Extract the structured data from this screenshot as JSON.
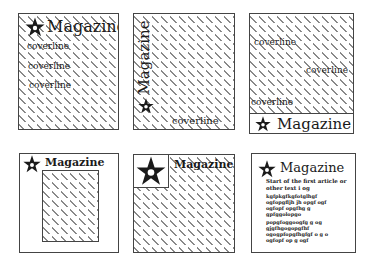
{
  "layouts": [
    {
      "id": "layout-1",
      "masthead": "Magazine",
      "coverlines": [
        "coverline",
        "coverline",
        "coverline"
      ]
    },
    {
      "id": "layout-2",
      "masthead": "Magazine",
      "masthead_orientation": "vertical",
      "coverlines": [
        "coverline"
      ]
    },
    {
      "id": "layout-3",
      "masthead": "Magazine",
      "masthead_position": "bottom-strip",
      "coverlines": [
        "coverline",
        "coverline",
        "coverline"
      ]
    },
    {
      "id": "layout-4",
      "masthead": "Magazine",
      "image": "inset-rectangle"
    },
    {
      "id": "layout-5",
      "masthead": "Magazine",
      "logo": "large-star-box"
    },
    {
      "id": "layout-6",
      "masthead": "Magazine",
      "article_intro": "Start of the first article or other text i og",
      "article_lines": [
        "kgfpkgfkgfotglhgf",
        "ogfopgfljh jh opgf ogf",
        "ogfopf opgfhg g",
        "gpfggolopgo",
        "popgfoggoogfg g og",
        "gjgfhgogopgfhf",
        "ogogpfopgfhgfgf o g o",
        "ogfopf op g ogf"
      ]
    }
  ],
  "icons": {
    "logo": "star-icon"
  }
}
